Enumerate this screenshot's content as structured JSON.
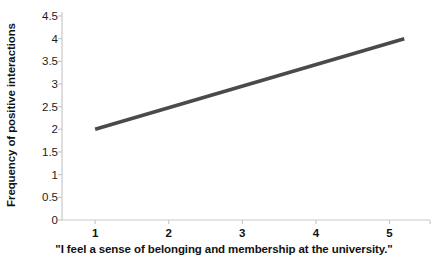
{
  "chart_data": {
    "type": "line",
    "title": "",
    "subtitle": "",
    "xlabel": "\"I feel a sense of belonging and membership at the university.\"",
    "ylabel": "Frequency of positive interactions",
    "xlim": [
      0.55,
      5.55
    ],
    "ylim": [
      0,
      4.5
    ],
    "grid": false,
    "legend": false,
    "legend_position": "none",
    "line_color": "#4a4a4a",
    "axis_color": "#c9c9c9",
    "background": "#ffffff",
    "xticks": [
      "1",
      "2",
      "3",
      "4",
      "5"
    ],
    "xtick_values": [
      1,
      2,
      3,
      4,
      5
    ],
    "yticks": [
      "0",
      "0.5",
      "1",
      "1.5",
      "2",
      "2.5",
      "3",
      "3.5",
      "4",
      "4.5"
    ],
    "ytick_values": [
      0,
      0.5,
      1,
      1.5,
      2,
      2.5,
      3,
      3.5,
      4,
      4.5
    ],
    "series": [
      {
        "name": "Frequency of positive interactions",
        "x": [
          1.0,
          5.2
        ],
        "values": [
          2.0,
          4.0
        ]
      }
    ],
    "annotations": []
  }
}
